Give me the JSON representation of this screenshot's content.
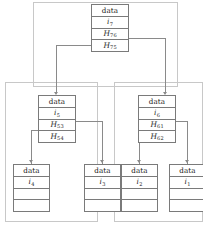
{
  "diagram": {
    "type": "merkle-hash-tree",
    "colors": {
      "node_border": "#7a7a7a",
      "group_border": "#c8c8c8",
      "connector": "#8a8a8a",
      "background": "#ffffff",
      "text": "#1a1a1a"
    },
    "labels": {
      "data": "data"
    },
    "nodes": [
      {
        "id": "root",
        "level": "root",
        "cells": [
          {
            "kind": "data",
            "text": "data"
          },
          {
            "kind": "index",
            "base": "i",
            "subscript": "7"
          },
          {
            "kind": "hash",
            "base": "H",
            "subscript": "76"
          },
          {
            "kind": "hash",
            "base": "H",
            "subscript": "75"
          }
        ]
      },
      {
        "id": "mid-left",
        "level": "middle",
        "cells": [
          {
            "kind": "data",
            "text": "data"
          },
          {
            "kind": "index",
            "base": "i",
            "subscript": "5"
          },
          {
            "kind": "hash",
            "base": "H",
            "subscript": "53"
          },
          {
            "kind": "hash",
            "base": "H",
            "subscript": "54"
          }
        ]
      },
      {
        "id": "mid-right",
        "level": "middle",
        "cells": [
          {
            "kind": "data",
            "text": "data"
          },
          {
            "kind": "index",
            "base": "i",
            "subscript": "6"
          },
          {
            "kind": "hash",
            "base": "H",
            "subscript": "61"
          },
          {
            "kind": "hash",
            "base": "H",
            "subscript": "62"
          }
        ]
      },
      {
        "id": "leaf-4",
        "level": "leaf",
        "cells": [
          {
            "kind": "data",
            "text": "data"
          },
          {
            "kind": "index",
            "base": "i",
            "subscript": "4"
          },
          {
            "kind": "empty",
            "text": ""
          },
          {
            "kind": "empty",
            "text": ""
          }
        ]
      },
      {
        "id": "leaf-3",
        "level": "leaf",
        "cells": [
          {
            "kind": "data",
            "text": "data"
          },
          {
            "kind": "index",
            "base": "i",
            "subscript": "3"
          },
          {
            "kind": "empty",
            "text": ""
          },
          {
            "kind": "empty",
            "text": ""
          }
        ]
      },
      {
        "id": "leaf-2",
        "level": "leaf",
        "cells": [
          {
            "kind": "data",
            "text": "data"
          },
          {
            "kind": "index",
            "base": "i",
            "subscript": "2"
          },
          {
            "kind": "empty",
            "text": ""
          },
          {
            "kind": "empty",
            "text": ""
          }
        ]
      },
      {
        "id": "leaf-1",
        "level": "leaf",
        "cells": [
          {
            "kind": "data",
            "text": "data"
          },
          {
            "kind": "index",
            "base": "i",
            "subscript": "1"
          },
          {
            "kind": "empty",
            "text": ""
          },
          {
            "kind": "empty",
            "text": ""
          }
        ]
      }
    ],
    "edges": [
      {
        "from": "root",
        "from_cell": "H76",
        "to": "mid-right"
      },
      {
        "from": "root",
        "from_cell": "H75",
        "to": "mid-left"
      },
      {
        "from": "mid-left",
        "from_cell": "H53",
        "to": "leaf-3"
      },
      {
        "from": "mid-left",
        "from_cell": "H54",
        "to": "leaf-4"
      },
      {
        "from": "mid-right",
        "from_cell": "H61",
        "to": "leaf-1"
      },
      {
        "from": "mid-right",
        "from_cell": "H62",
        "to": "leaf-2"
      }
    ],
    "groups": [
      {
        "id": "group-top",
        "contains": [
          "root",
          "mid-left",
          "mid-right"
        ]
      },
      {
        "id": "group-left",
        "contains": [
          "mid-left",
          "leaf-4",
          "leaf-3"
        ]
      },
      {
        "id": "group-right",
        "contains": [
          "mid-right",
          "leaf-2",
          "leaf-1"
        ]
      }
    ]
  }
}
